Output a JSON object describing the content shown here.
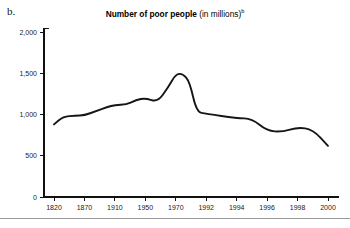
{
  "panel": {
    "label": "b."
  },
  "title": {
    "main": "Number of poor people",
    "sub": " (in millions)",
    "superscript": "b"
  },
  "chart_data": {
    "type": "line",
    "title": "Number of poor people (in millions)",
    "xlabel": "",
    "ylabel": "",
    "ylim": [
      0,
      2000
    ],
    "yticks": [
      0,
      500,
      1000,
      1500,
      2000
    ],
    "ytick_labels": [
      "0",
      "500",
      "1,000",
      "1,500",
      "2,000"
    ],
    "grid": false,
    "legend": false,
    "categories": [
      "1820",
      "1870",
      "1910",
      "1950",
      "1970",
      "1992",
      "1994",
      "1996",
      "1998",
      "2000"
    ],
    "axis_note": "x axis ticks are evenly spaced although year intervals are irregular",
    "x": [
      1820,
      1870,
      1910,
      1950,
      1970,
      1992,
      1994,
      1996,
      1998,
      2000
    ],
    "values": [
      880,
      990,
      1060,
      1190,
      1500,
      960,
      800,
      850,
      700,
      620
    ],
    "series": [
      {
        "name": "Number of poor people",
        "units": "millions",
        "values": [
          880,
          990,
          1060,
          1190,
          1500,
          960,
          800,
          850,
          700,
          620
        ]
      }
    ],
    "detailed_points": [
      {
        "x": 1820,
        "y": 880
      },
      {
        "x": 1835,
        "y": 975
      },
      {
        "x": 1855,
        "y": 985
      },
      {
        "x": 1870,
        "y": 990
      },
      {
        "x": 1885,
        "y": 1040
      },
      {
        "x": 1900,
        "y": 1090
      },
      {
        "x": 1910,
        "y": 1115
      },
      {
        "x": 1925,
        "y": 1120
      },
      {
        "x": 1938,
        "y": 1175
      },
      {
        "x": 1950,
        "y": 1200
      },
      {
        "x": 1958,
        "y": 1150
      },
      {
        "x": 1965,
        "y": 1330
      },
      {
        "x": 1970,
        "y": 1490
      },
      {
        "x": 1975,
        "y": 1495
      },
      {
        "x": 1980,
        "y": 1400
      },
      {
        "x": 1985,
        "y": 1030
      },
      {
        "x": 1992,
        "y": 1010
      },
      {
        "x": 1994,
        "y": 955
      },
      {
        "x": 1995,
        "y": 950
      },
      {
        "x": 1996,
        "y": 800
      },
      {
        "x": 1997,
        "y": 790
      },
      {
        "x": 1998,
        "y": 845
      },
      {
        "x": 1999,
        "y": 820
      },
      {
        "x": 2000,
        "y": 620
      }
    ],
    "annotations": {
      "peak": {
        "label": "peak near 1,500",
        "x": 1970,
        "y": 1500
      },
      "start": {
        "label": "start near 880",
        "x": 1820,
        "y": 880
      },
      "end": {
        "label": "end near 620",
        "x": 2000,
        "y": 620
      }
    },
    "colors": {
      "line": "#161616",
      "axis": "#111111",
      "background": "#ffffff"
    }
  }
}
